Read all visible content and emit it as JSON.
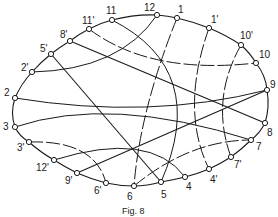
{
  "figure": {
    "caption": "Fig. 8",
    "stroke_color": "#1a1a1a",
    "background": "#ffffff"
  },
  "nodes": [
    {
      "id": "11",
      "label": "11",
      "x": 112,
      "y": 20,
      "lx": 106,
      "ly": 6
    },
    {
      "id": "12",
      "label": "12",
      "x": 157,
      "y": 15,
      "lx": 144,
      "ly": 3
    },
    {
      "id": "1",
      "label": "1",
      "x": 177,
      "y": 18,
      "lx": 178,
      "ly": 5
    },
    {
      "id": "1p",
      "label": "1'",
      "x": 209,
      "y": 28,
      "lx": 211,
      "ly": 15
    },
    {
      "id": "10p",
      "label": "10'",
      "x": 241,
      "y": 45,
      "lx": 240,
      "ly": 31
    },
    {
      "id": "10",
      "label": "10",
      "x": 256,
      "y": 63,
      "lx": 259,
      "ly": 50
    },
    {
      "id": "9",
      "label": "9",
      "x": 267,
      "y": 90,
      "lx": 270,
      "ly": 80
    },
    {
      "id": "8",
      "label": "8",
      "x": 265,
      "y": 123,
      "lx": 267,
      "ly": 128
    },
    {
      "id": "7",
      "label": "7",
      "x": 251,
      "y": 140,
      "lx": 256,
      "ly": 142
    },
    {
      "id": "7p",
      "label": "7'",
      "x": 231,
      "y": 157,
      "lx": 234,
      "ly": 160
    },
    {
      "id": "4p",
      "label": "4'",
      "x": 209,
      "y": 169,
      "lx": 210,
      "ly": 175
    },
    {
      "id": "4",
      "label": "4",
      "x": 185,
      "y": 177,
      "lx": 186,
      "ly": 182
    },
    {
      "id": "5",
      "label": "5",
      "x": 161,
      "y": 182,
      "lx": 161,
      "ly": 190
    },
    {
      "id": "6",
      "label": "6",
      "x": 134,
      "y": 186,
      "lx": 127,
      "ly": 192
    },
    {
      "id": "6p",
      "label": "6'",
      "x": 106,
      "y": 183,
      "lx": 94,
      "ly": 186
    },
    {
      "id": "9p",
      "label": "9'",
      "x": 77,
      "y": 173,
      "lx": 65,
      "ly": 176
    },
    {
      "id": "12p",
      "label": "12'",
      "x": 54,
      "y": 160,
      "lx": 36,
      "ly": 163
    },
    {
      "id": "3p",
      "label": "3'",
      "x": 29,
      "y": 142,
      "lx": 17,
      "ly": 143
    },
    {
      "id": "3",
      "label": "3",
      "x": 15,
      "y": 127,
      "lx": 3,
      "ly": 122
    },
    {
      "id": "2",
      "label": "2",
      "x": 15,
      "y": 98,
      "lx": 4,
      "ly": 88
    },
    {
      "id": "2p",
      "label": "2'",
      "x": 32,
      "y": 72,
      "lx": 21,
      "ly": 63
    },
    {
      "id": "5p",
      "label": "5'",
      "x": 51,
      "y": 54,
      "lx": 40,
      "ly": 44
    },
    {
      "id": "8p",
      "label": "8'",
      "x": 70,
      "y": 41,
      "lx": 60,
      "ly": 30
    },
    {
      "id": "11p",
      "label": "11'",
      "x": 89,
      "y": 29,
      "lx": 82,
      "ly": 16
    }
  ],
  "outline": "M112,20 Q135,14 157,15 Q168,16 177,18 Q194,22 209,28 Q226,35 241,45 Q250,53 256,63 Q266,76 267,90 Q270,107 265,123 Q260,133 251,140 Q242,149 231,157 Q220,164 209,169 Q197,174 185,177 Q173,180 161,182 Q147,186 134,186 Q120,186 106,183 Q91,179 77,173 Q65,167 54,160 Q40,152 29,142 Q19,136 15,127 Q10,113 15,98 Q21,84 32,72 Q41,62 51,54 Q60,47 70,41 Q79,34 89,29 Q100,23 112,20",
  "curves": [
    {
      "from": "11",
      "to": "5",
      "d": "M112,20 Q210,70 161,182",
      "dashed": false
    },
    {
      "from": "12",
      "to": "2p",
      "d": "M157,15 Q120,70 32,72",
      "dashed": false
    },
    {
      "from": "1",
      "to": "6",
      "d": "M177,18 Q140,110 134,186",
      "dashed": true
    },
    {
      "from": "1p",
      "to": "4p",
      "d": "M209,28 Q180,110 209,169",
      "dashed": true
    },
    {
      "from": "10p",
      "to": "7p",
      "d": "M241,45 Q210,100 231,157",
      "dashed": true
    },
    {
      "from": "11p",
      "to": "10",
      "d": "M89,29 Q150,75 256,63",
      "dashed": true
    },
    {
      "from": "2",
      "to": "9",
      "d": "M15,98 Q150,120 267,90",
      "dashed": false
    },
    {
      "from": "3",
      "to": "7",
      "d": "M15,127 Q110,95 251,140",
      "dashed": false
    },
    {
      "from": "3p",
      "to": "6p",
      "d": "M29,142 Q95,140 106,183",
      "dashed": true
    },
    {
      "from": "12p",
      "to": "4",
      "d": "M54,160 Q150,130 185,177",
      "dashed": false
    },
    {
      "from": "6",
      "to": "7",
      "d": "M134,186 Q190,140 251,140",
      "dashed": true
    }
  ],
  "lines": [
    {
      "from": "5p",
      "to": "5",
      "x1": 51,
      "y1": 54,
      "x2": 161,
      "y2": 182
    },
    {
      "from": "8p",
      "to": "8",
      "x1": 70,
      "y1": 41,
      "x2": 265,
      "y2": 123
    },
    {
      "from": "9p",
      "to": "9",
      "x1": 77,
      "y1": 173,
      "x2": 267,
      "y2": 90
    }
  ]
}
